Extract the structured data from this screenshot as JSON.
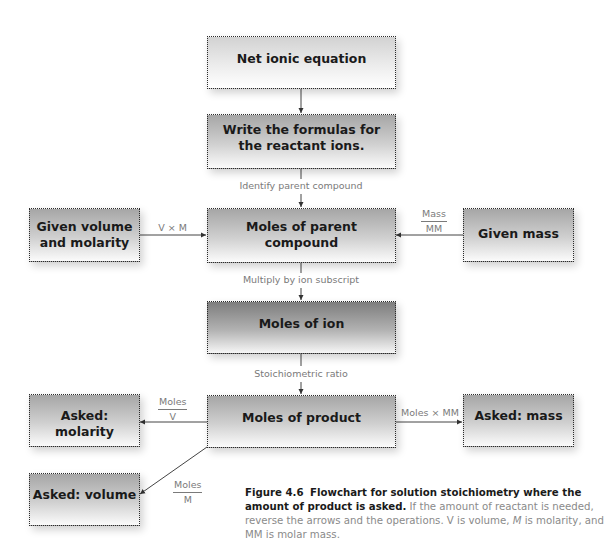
{
  "nodes": {
    "net_ionic": "Net ionic equation",
    "write_formulas_1": "Write the formulas for",
    "write_formulas_2": "the reactant ions.",
    "moles_parent_1": "Moles of parent",
    "moles_parent_2": "compound",
    "given_volume_1": "Given volume",
    "given_volume_2": "and molarity",
    "given_mass": "Given mass",
    "moles_ion": "Moles of ion",
    "moles_product": "Moles of product",
    "asked_molarity": "Asked: molarity",
    "asked_mass": "Asked: mass",
    "asked_volume": "Asked: volume"
  },
  "edges": {
    "identify_parent": "Identify parent compound",
    "v_times_m": "V × M",
    "mass_over_mm": {
      "num": "Mass",
      "den": "MM"
    },
    "multiply_subscript": "Multiply by ion subscript",
    "stoich_ratio": "Stoichiometric ratio",
    "moles_over_v": {
      "num": "Moles",
      "den": "V"
    },
    "moles_times_mm": "Moles × MM",
    "moles_over_m": {
      "num": "Moles",
      "den": "M"
    }
  },
  "caption": {
    "label": "Figure 4.6",
    "title": "Flowchart for solution stoichiometry where the amount of product is asked.",
    "body_1": "If the amount of reactant is needed, reverse the arrows and the operations. V is volume,",
    "italic_m": "M",
    "body_2": "is molarity, and MM is molar mass."
  }
}
